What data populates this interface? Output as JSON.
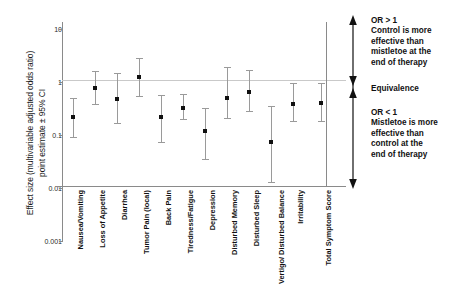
{
  "chart_data": {
    "type": "scatter",
    "title": "",
    "xlabel": "",
    "ylabel_line_1": "Effect size (multivariable adjusted odds ratio)",
    "ylabel_line_2": "point estimate ± 95% CI",
    "yscale": "log",
    "ylim": [
      0.001,
      10
    ],
    "yticks": [
      "10",
      "1",
      "0.1",
      "0.01",
      "0.001"
    ],
    "ytick_values": [
      10,
      1,
      0.1,
      0.01,
      0.001
    ],
    "grid": false,
    "reference_line": 1,
    "legend": "none",
    "categories": [
      "Nausea/Vomiting",
      "Loss of Appetite",
      "Diarrhea",
      "Tumor Pain (local)",
      "Back Pain",
      "Tiredness/Fatigue",
      "Depression",
      "Disturbed Memory",
      "Disturbed Sleep",
      "Vertigo/ Disturbed Balance",
      "Irritability",
      "Total Symptom Score"
    ],
    "series": [
      {
        "name": "Odds ratio (point estimate ± 95% CI)",
        "values": [
          0.22,
          0.78,
          0.48,
          1.25,
          0.22,
          0.33,
          0.12,
          0.5,
          0.65,
          0.075,
          0.38,
          0.4
        ],
        "ci_low": [
          0.09,
          0.39,
          0.17,
          0.54,
          0.075,
          0.2,
          0.035,
          0.21,
          0.28,
          0.013,
          0.18,
          0.18
        ],
        "ci_high": [
          0.5,
          1.6,
          1.45,
          2.85,
          0.56,
          0.6,
          0.33,
          1.9,
          1.65,
          0.36,
          0.95,
          0.95
        ]
      }
    ],
    "annotations": {
      "arrow": "vertical-double-headed-arrow",
      "top_block": "OR > 1\nControl is more\neffective than\nmistletoe at the\nend of therapy",
      "middle_block": "Equivalence",
      "bottom_block": "OR < 1\nMistletoe is more\neffective than\ncontrol at the\nend of therapy"
    }
  },
  "annotations": {
    "top": {
      "l1": "OR > 1",
      "l2": "Control is more",
      "l3": "effective than",
      "l4": "mistletoe at the",
      "l5": "end of therapy"
    },
    "middle": {
      "l1": "Equivalence"
    },
    "bottom": {
      "l1": "OR < 1",
      "l2": "Mistletoe is more",
      "l3": "effective than",
      "l4": "control at the",
      "l5": "end of therapy"
    }
  }
}
